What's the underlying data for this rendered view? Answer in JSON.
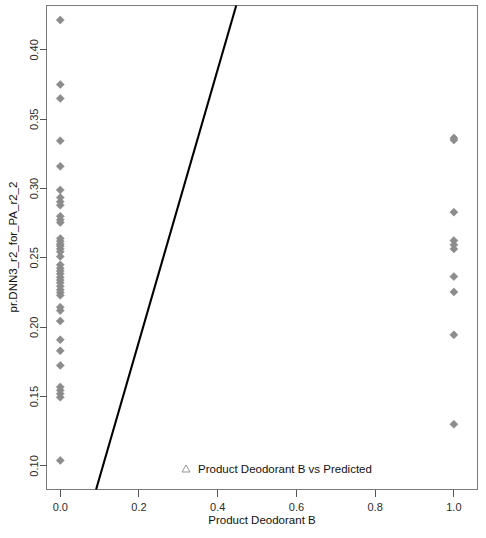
{
  "chart_data": {
    "type": "scatter",
    "title": "",
    "xlabel": "Product Deodorant B",
    "ylabel": "pr.DNN3_r2_for_PA_r2_2",
    "xlim": [
      -0.035,
      1.06
    ],
    "ylim": [
      0.083,
      0.432
    ],
    "xticks": [
      0.0,
      0.2,
      0.4,
      0.6,
      0.8,
      1.0
    ],
    "xticklabels": [
      "0.0",
      "0.2",
      "0.4",
      "0.6",
      "0.8",
      "1.0"
    ],
    "yticks": [
      0.1,
      0.15,
      0.2,
      0.25,
      0.3,
      0.35,
      0.4
    ],
    "yticklabels": [
      "0.10",
      "0.15",
      "0.20",
      "0.25",
      "0.30",
      "0.35",
      "0.40"
    ],
    "grid": false,
    "legend": {
      "position": "bottom-center-inside",
      "entries": [
        {
          "label": "Product Deodorant B vs Predicted",
          "marker": "triangle-up",
          "color": "#8c8c8c"
        }
      ]
    },
    "series": [
      {
        "name": "Product Deodorant B vs Predicted",
        "marker": "diamond",
        "color": "#8c8c8c",
        "points": [
          [
            0.0,
            0.4215
          ],
          [
            0.0,
            0.375
          ],
          [
            0.0,
            0.365
          ],
          [
            0.0,
            0.3345
          ],
          [
            0.0,
            0.316
          ],
          [
            0.0,
            0.299
          ],
          [
            0.0,
            0.2935
          ],
          [
            0.0,
            0.2905
          ],
          [
            0.0,
            0.288
          ],
          [
            0.0,
            0.28
          ],
          [
            0.0,
            0.2775
          ],
          [
            0.0,
            0.2755
          ],
          [
            0.0,
            0.264
          ],
          [
            0.0,
            0.262
          ],
          [
            0.0,
            0.26
          ],
          [
            0.0,
            0.2585
          ],
          [
            0.0,
            0.2565
          ],
          [
            0.0,
            0.2545
          ],
          [
            0.0,
            0.251
          ],
          [
            0.0,
            0.245
          ],
          [
            0.0,
            0.2425
          ],
          [
            0.0,
            0.2405
          ],
          [
            0.0,
            0.2385
          ],
          [
            0.0,
            0.236
          ],
          [
            0.0,
            0.234
          ],
          [
            0.0,
            0.232
          ],
          [
            0.0,
            0.2295
          ],
          [
            0.0,
            0.227
          ],
          [
            0.0,
            0.225
          ],
          [
            0.0,
            0.223
          ],
          [
            0.0,
            0.2145
          ],
          [
            0.0,
            0.212
          ],
          [
            0.0,
            0.2045
          ],
          [
            0.0,
            0.191
          ],
          [
            0.0,
            0.183
          ],
          [
            0.0,
            0.1725
          ],
          [
            0.0,
            0.157
          ],
          [
            0.0,
            0.1545
          ],
          [
            0.0,
            0.152
          ],
          [
            0.0,
            0.1495
          ],
          [
            0.0,
            0.104
          ],
          [
            1.0,
            0.3365
          ],
          [
            1.0,
            0.335
          ],
          [
            1.0,
            0.283
          ],
          [
            1.0,
            0.2625
          ],
          [
            1.0,
            0.2595
          ],
          [
            1.0,
            0.2565
          ],
          [
            1.0,
            0.2365
          ],
          [
            1.0,
            0.2255
          ],
          [
            1.0,
            0.1945
          ],
          [
            1.0,
            0.13
          ]
        ]
      }
    ],
    "fit_line": {
      "name": "regression-line",
      "color": "#000000",
      "x_start": 0.091,
      "y_start": 0.083,
      "x_end": 0.447,
      "y_end": 0.432
    }
  }
}
